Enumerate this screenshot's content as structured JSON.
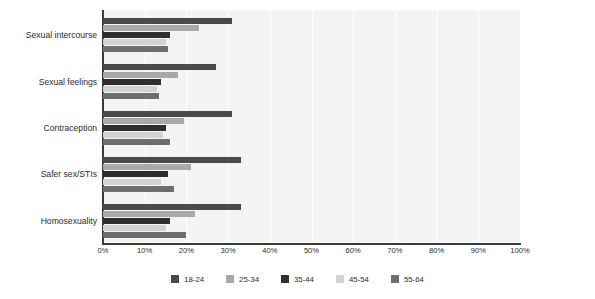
{
  "chart_data": {
    "type": "bar",
    "orientation": "horizontal",
    "title": "",
    "xlabel": "",
    "ylabel": "",
    "xlim": [
      0,
      100
    ],
    "grid": true,
    "legend_position": "bottom",
    "categories": [
      "Sexual intercourse",
      "Sexual feelings",
      "Contraception",
      "Safer sex/STIs",
      "Homosexuality"
    ],
    "xticks": [
      "0%",
      "10%",
      "20%",
      "30%",
      "40%",
      "50%",
      "60%",
      "70%",
      "80%",
      "90%",
      "100%"
    ],
    "xtick_values": [
      0,
      10,
      20,
      30,
      40,
      50,
      60,
      70,
      80,
      90,
      100
    ],
    "series": [
      {
        "name": "18-24",
        "color": "#4a4a4a",
        "values": [
          31,
          27,
          31,
          33,
          33
        ]
      },
      {
        "name": "25-34",
        "color": "#a8a8a8",
        "values": [
          23,
          18,
          19.5,
          21,
          22
        ]
      },
      {
        "name": "35-44",
        "color": "#2e2e2e",
        "values": [
          16,
          14,
          15,
          15.5,
          16
        ]
      },
      {
        "name": "45-54",
        "color": "#d2d2d2",
        "values": [
          15,
          13,
          14.5,
          14,
          15
        ]
      },
      {
        "name": "55-64",
        "color": "#6e6e6e",
        "values": [
          15.5,
          13.5,
          16,
          17,
          20
        ]
      }
    ]
  },
  "colors": {
    "plot_background": "#f4f4f4",
    "gridline": "#ffffff",
    "axis": "#3a3a3a",
    "text": "#2b2b2b"
  }
}
